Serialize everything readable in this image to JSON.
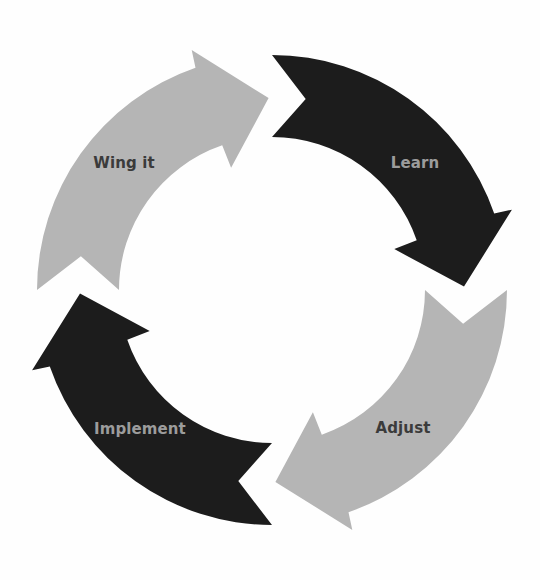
{
  "diagram": {
    "type": "cycle",
    "steps": [
      {
        "label": "Wing it",
        "color": "#b5b5b5",
        "text_color": "#3b3b3b"
      },
      {
        "label": "Learn",
        "color": "#1c1c1c",
        "text_color": "#9c9c9c"
      },
      {
        "label": "Adjust",
        "color": "#b5b5b5",
        "text_color": "#3b3b3b"
      },
      {
        "label": "Implement",
        "color": "#1c1c1c",
        "text_color": "#9c9c9c"
      }
    ]
  }
}
